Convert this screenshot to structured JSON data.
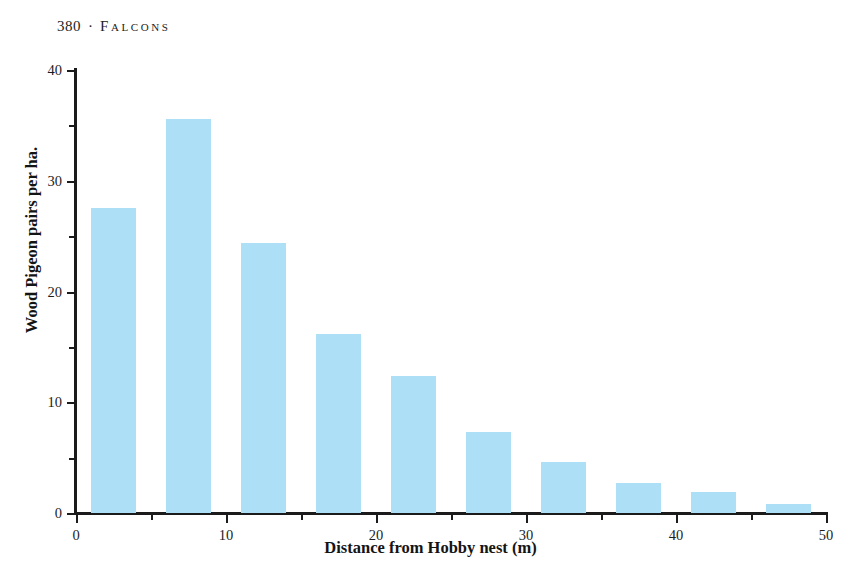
{
  "running_head": {
    "folio": "380",
    "separator": "·",
    "title": "Falcons"
  },
  "chart_data": {
    "type": "bar",
    "title": "",
    "xlabel": "Distance from Hobby nest (m)",
    "ylabel": "Wood Pigeon pairs per ha.",
    "xlim": [
      0,
      50
    ],
    "ylim": [
      0,
      40
    ],
    "grid": false,
    "legend": null,
    "bar_color": "#ade0f7",
    "axis_color": "#1b1b1b",
    "bar_width": 3,
    "bin_width": 5,
    "bar_offset": 1,
    "categories": [
      "0-5",
      "5-10",
      "10-15",
      "15-20",
      "20-25",
      "25-30",
      "30-35",
      "35-40",
      "40-45",
      "45-50"
    ],
    "x": [
      2.5,
      7.5,
      12.5,
      17.5,
      22.5,
      27.5,
      32.5,
      37.5,
      42.5,
      47.5
    ],
    "values": [
      27.5,
      35.6,
      24.4,
      16.2,
      12.4,
      7.3,
      4.6,
      2.7,
      1.9,
      0.8
    ],
    "x_ticks_major": [
      0,
      10,
      20,
      30,
      40,
      50
    ],
    "x_ticks_major_labels": [
      "0",
      "10",
      "20",
      "30",
      "40",
      "50"
    ],
    "x_ticks_minor": [
      5,
      15,
      25,
      35,
      45
    ],
    "y_ticks_major": [
      0,
      10,
      20,
      30,
      40
    ],
    "y_ticks_major_labels": [
      "0",
      "10",
      "20",
      "30",
      "40"
    ],
    "y_ticks_minor": [
      5,
      15,
      25,
      35
    ]
  }
}
